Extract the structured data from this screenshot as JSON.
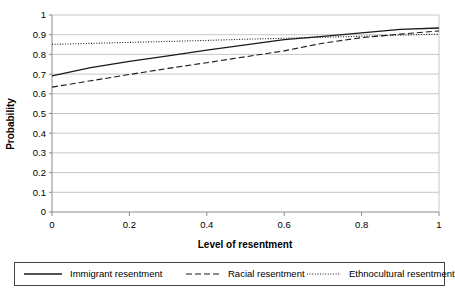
{
  "chart_data": {
    "type": "line",
    "title": "",
    "xlabel": "Level of resentment",
    "ylabel": "Probability",
    "xlim": [
      0,
      1
    ],
    "ylim": [
      0,
      1
    ],
    "grid": true,
    "legend_position": "bottom",
    "x_ticks": [
      "0",
      "0.2",
      "0.4",
      "0.6",
      "0.8",
      "1"
    ],
    "x_tick_values": [
      0,
      0.2,
      0.4,
      0.6,
      0.8,
      1
    ],
    "y_ticks": [
      "0",
      "0.1",
      "0.2",
      "0.3",
      "0.4",
      "0.5",
      "0.6",
      "0.7",
      "0.8",
      "0.9",
      "1"
    ],
    "y_tick_values": [
      0,
      0.1,
      0.2,
      0.3,
      0.4,
      0.5,
      0.6,
      0.7,
      0.8,
      0.9,
      1
    ],
    "x": [
      0,
      0.1,
      0.2,
      0.3,
      0.4,
      0.5,
      0.6,
      0.7,
      0.8,
      0.9,
      1
    ],
    "series": [
      {
        "name": "Immigrant resentment",
        "style": "solid",
        "color": "#1a1a1a",
        "values": [
          0.691,
          0.733,
          0.765,
          0.792,
          0.822,
          0.848,
          0.875,
          0.892,
          0.909,
          0.927,
          0.934
        ]
      },
      {
        "name": "Racial resentment",
        "style": "dashed",
        "color": "#1a1a1a",
        "values": [
          0.634,
          0.666,
          0.698,
          0.729,
          0.758,
          0.788,
          0.818,
          0.857,
          0.885,
          0.903,
          0.919
        ]
      },
      {
        "name": "Ethnocultural resentment",
        "style": "dotted",
        "color": "#1a1a1a",
        "values": [
          0.851,
          0.856,
          0.861,
          0.866,
          0.871,
          0.877,
          0.882,
          0.887,
          0.892,
          0.898,
          0.903
        ]
      }
    ]
  },
  "legend": {
    "entries": [
      {
        "label": "Immigrant resentment",
        "style": "solid"
      },
      {
        "label": "Racial resentment",
        "style": "dashed"
      },
      {
        "label": "Ethnocultural resentment",
        "style": "dotted"
      }
    ]
  },
  "colors": {
    "background": "#ffffff",
    "grid": "#b9b9b9",
    "axis": "#8a8a8a",
    "line": "#1a1a1a",
    "legend_border": "#444444"
  }
}
